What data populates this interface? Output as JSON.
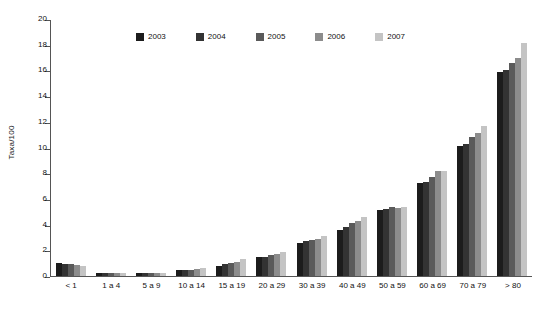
{
  "chart_data": {
    "type": "bar",
    "title": "",
    "xlabel": "",
    "ylabel": "Taxa/100",
    "ylim": [
      0,
      20
    ],
    "yticks": [
      0,
      2,
      4,
      6,
      8,
      10,
      12,
      14,
      16,
      18,
      20
    ],
    "grid": false,
    "legend_position": "top-center",
    "categories": [
      "< 1",
      "1 a 4",
      "5 a 9",
      "10 a 14",
      "15 a 19",
      "20 a 29",
      "30 a 39",
      "40 a 49",
      "50 a 59",
      "60 a 69",
      "70 a 79",
      "> 80"
    ],
    "series": [
      {
        "name": "2003",
        "color": "#1c1c1c",
        "values": [
          1.0,
          0.25,
          0.2,
          0.45,
          0.8,
          1.5,
          2.6,
          3.6,
          5.1,
          7.2,
          10.1,
          15.9
        ]
      },
      {
        "name": "2004",
        "color": "#333333",
        "values": [
          0.95,
          0.25,
          0.2,
          0.45,
          0.9,
          1.5,
          2.7,
          3.8,
          5.2,
          7.3,
          10.3,
          16.0
        ]
      },
      {
        "name": "2005",
        "color": "#5a5a5a",
        "values": [
          0.9,
          0.25,
          0.2,
          0.5,
          1.0,
          1.6,
          2.8,
          4.1,
          5.4,
          7.7,
          10.8,
          16.6
        ]
      },
      {
        "name": "2006",
        "color": "#8c8c8c",
        "values": [
          0.85,
          0.25,
          0.25,
          0.55,
          1.1,
          1.7,
          2.9,
          4.3,
          5.3,
          8.2,
          11.1,
          17.0
        ]
      },
      {
        "name": "2007",
        "color": "#c4c4c4",
        "values": [
          0.8,
          0.25,
          0.25,
          0.6,
          1.3,
          1.9,
          3.1,
          4.6,
          5.4,
          8.2,
          11.7,
          18.1
        ]
      }
    ]
  },
  "axis": {
    "y_title": "Taxa/100"
  }
}
